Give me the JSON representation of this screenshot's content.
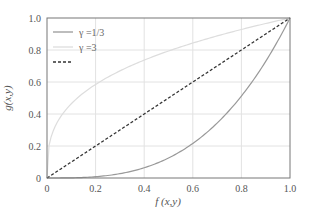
{
  "chart_data": {
    "type": "line",
    "title": "",
    "xlabel": "f(x,y)",
    "ylabel": "g(x,y)",
    "xlim": [
      0,
      1
    ],
    "ylim": [
      0,
      1
    ],
    "grid": true,
    "legend_position": "upper left",
    "xticks": [
      "0",
      "0.2",
      "0.4",
      "0.6",
      "0.8",
      "1.0"
    ],
    "yticks": [
      "0",
      "0.2",
      "0.4",
      "0.6",
      "0.8",
      "1.0"
    ],
    "x": [
      0,
      0.1,
      0.2,
      0.3,
      0.4,
      0.5,
      0.6,
      0.7,
      0.8,
      0.9,
      1.0
    ],
    "series": [
      {
        "name": "γ =1/3",
        "style": "solid",
        "color": "#999999",
        "values": [
          0,
          0.001,
          0.008,
          0.027,
          0.064,
          0.125,
          0.216,
          0.343,
          0.512,
          0.729,
          1.0
        ]
      },
      {
        "name": "γ =3",
        "style": "solid",
        "color": "#dddddd",
        "values": [
          0,
          0.464,
          0.585,
          0.669,
          0.737,
          0.794,
          0.843,
          0.888,
          0.928,
          0.965,
          1.0
        ]
      },
      {
        "name": "",
        "style": "dashed",
        "color": "#333333",
        "values": [
          0,
          0.1,
          0.2,
          0.3,
          0.4,
          0.5,
          0.6,
          0.7,
          0.8,
          0.9,
          1.0
        ]
      }
    ]
  },
  "legend": [
    {
      "label": "γ =1/3",
      "color": "#999999",
      "dash": ""
    },
    {
      "label": "γ =3",
      "color": "#dddddd",
      "dash": ""
    },
    {
      "label": "",
      "color": "#333333",
      "dash": "3,2"
    }
  ],
  "axes": {
    "xlabel": "f (x,y)",
    "ylabel": "g(x,y)",
    "xticks": [
      "0",
      "0.2",
      "0.4",
      "0.6",
      "0.8",
      "1.0"
    ],
    "yticks": [
      "0",
      "0.2",
      "0.4",
      "0.6",
      "0.8",
      "1.0"
    ]
  }
}
